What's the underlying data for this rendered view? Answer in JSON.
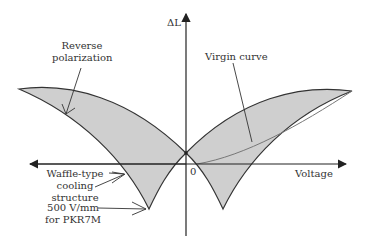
{
  "diagram": {
    "type": "butterfly-strain-curve",
    "axes": {
      "y_label": "ΔL",
      "x_label": "Voltage",
      "origin_label": "0"
    },
    "annotations": {
      "reverse_polarization_line1": "Reverse",
      "reverse_polarization_line2": "polarization",
      "virgin_curve": "Virgin curve",
      "waffle_line1": "Waffle-type",
      "waffle_line2": "cooling",
      "waffle_line3": "structure",
      "field_line1": "500 V/mm",
      "field_line2": "for PKR7M"
    },
    "colors": {
      "fill": "#cfcfcf",
      "stroke": "#333333",
      "virgin_curve": "#777777",
      "text": "#333333"
    }
  }
}
